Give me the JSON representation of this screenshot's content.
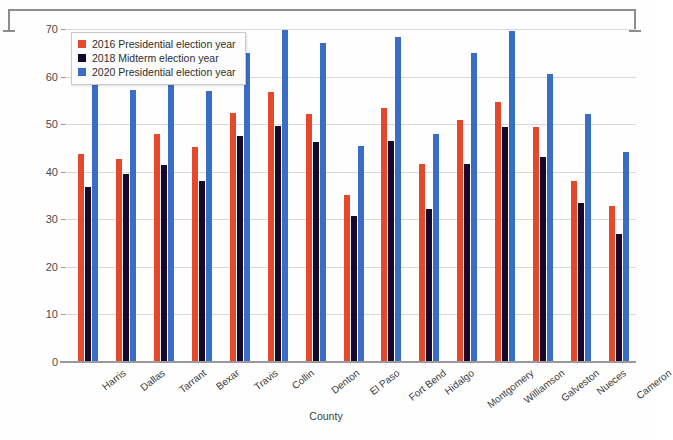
{
  "chart_data": {
    "type": "bar",
    "title": "",
    "xlabel": "County",
    "ylabel": "Percent of Voters",
    "ylim": [
      0,
      70
    ],
    "yticks": [
      0,
      10,
      20,
      30,
      40,
      50,
      60,
      70
    ],
    "grid": true,
    "legend_position": "top-left",
    "categories": [
      "Harris",
      "Dallas",
      "Tarrant",
      "Bexar",
      "Travis",
      "Collin",
      "Denton",
      "El Paso",
      "Fort Bend",
      "Hidalgo",
      "Montgomery",
      "Williamson",
      "Galveston",
      "Nueces",
      "Cameron"
    ],
    "series": [
      {
        "name": "2016 Presidential election year",
        "color": "#e4492c",
        "values": [
          43.8,
          42.7,
          47.9,
          45.3,
          52.3,
          56.7,
          52.1,
          35.2,
          53.4,
          41.7,
          50.8,
          54.7,
          49.4,
          38.1,
          32.9
        ]
      },
      {
        "name": "2018 Midterm election year",
        "color": "#16082c",
        "values": [
          36.7,
          39.6,
          41.5,
          38.1,
          47.6,
          49.6,
          46.3,
          30.6,
          46.4,
          32.1,
          41.7,
          49.5,
          43.0,
          33.4,
          27.0
        ]
      },
      {
        "name": "2020 Presidential election year",
        "color": "#3a6dc4",
        "values": [
          58.3,
          57.2,
          61.5,
          57.0,
          64.9,
          69.7,
          67.0,
          45.5,
          68.4,
          48.0,
          65.0,
          69.6,
          60.5,
          52.2,
          44.2
        ]
      }
    ]
  },
  "annotations": {
    "top_bracket_name": "measurement-bracket"
  }
}
